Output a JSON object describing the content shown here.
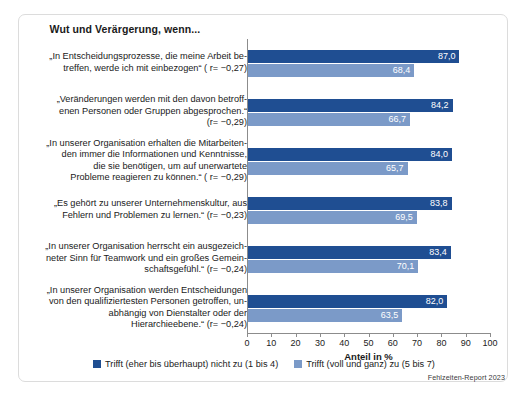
{
  "chart_data": {
    "type": "bar",
    "orientation": "horizontal",
    "title": "Wut und Verärgerung, wenn...",
    "xlabel": "Anteil in %",
    "ylabel": "",
    "xlim": [
      0,
      100
    ],
    "xticks": [
      0,
      10,
      20,
      30,
      40,
      50,
      60,
      70,
      80,
      90,
      100
    ],
    "grid": false,
    "legend_position": "bottom",
    "colors": {
      "dark_blue": "#1f4e92",
      "light_blue": "#7b9ac8",
      "frame": "#dcdcdc"
    },
    "categories": [
      "„In Entscheidungsprozesse, die meine Arbeit be-\ntreffen, werde ich mit einbezogen“ ( r= −0,27)",
      "„Veränderungen werden mit den davon betroff-\nenen Personen oder Gruppen abgesprochen.“\n(r= −0,29)",
      "„In unserer Organisation erhalten die Mitarbeiten-\nden immer die Informationen und Kenntnisse,\ndie sie benötigen, um auf unerwartete\nProbleme reagieren zu können.“ ( r= −0,29)",
      "„Es gehört zu unserer Unternehmenskultur, aus\nFehlern und Problemen zu lernen.“ (r= −0,23)",
      "„In unserer Organisation herrscht ein ausgezeich-\nneter Sinn für Teamwork und ein großes Gemein-\nschaftsgefühl.“ (r= −0,24)",
      "„In unserer Organisation werden Entscheidungen\nvon den qualifiziertesten Personen getroffen, un-\nabhängig von Dienstalter oder der\nHierarchieebene.“ (r= −0,24)"
    ],
    "series": [
      {
        "name": "Trifft (eher bis überhaupt) nicht zu (1 bis 4)",
        "color": "#1f4e92",
        "values": [
          87.0,
          84.2,
          84.0,
          83.8,
          83.4,
          82.0
        ],
        "labels": [
          "87,0",
          "84,2",
          "84,0",
          "83,8",
          "83,4",
          "82,0"
        ]
      },
      {
        "name": "Trifft (voll und ganz) zu (5 bis 7)",
        "color": "#7b9ac8",
        "values": [
          68.4,
          66.7,
          65.7,
          69.5,
          70.1,
          63.5
        ],
        "labels": [
          "68,4",
          "66,7",
          "65,7",
          "69,5",
          "70,1",
          "63,5"
        ]
      }
    ]
  },
  "source": "Fehlzeiten-Report 2023"
}
